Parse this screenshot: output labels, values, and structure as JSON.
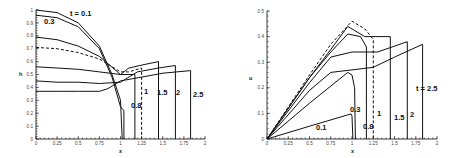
{
  "chart_data": [
    {
      "type": "line",
      "title": "",
      "xlabel": "x",
      "ylabel": "h",
      "xlim": [
        0,
        2
      ],
      "ylim": [
        0,
        1
      ],
      "xticks": [
        "0",
        "0.25",
        "0.5",
        "0.75",
        "1",
        "1.25",
        "1.5",
        "1.75",
        "2"
      ],
      "yticks": [
        "0",
        "0.1",
        "0.2",
        "0.3",
        "0.4",
        "0.5",
        "0.6",
        "0.7",
        "0.8",
        "0.9",
        "1"
      ],
      "grid": false,
      "legend": "inline curve labels",
      "series": [
        {
          "name": "t = 0.1",
          "style": "solid",
          "x": [
            0,
            0.25,
            0.5,
            0.75,
            0.9,
            1.0,
            1.02
          ],
          "y": [
            1.0,
            0.98,
            0.9,
            0.72,
            0.5,
            0.3,
            0.0
          ]
        },
        {
          "name": "0.3",
          "style": "solid",
          "x": [
            0,
            0.25,
            0.5,
            0.75,
            0.9,
            1.0,
            1.04,
            1.04
          ],
          "y": [
            0.96,
            0.94,
            0.87,
            0.7,
            0.48,
            0.25,
            0.22,
            0.0
          ]
        },
        {
          "name": "0.8",
          "style": "solid",
          "x": [
            0,
            0.25,
            0.5,
            0.75,
            1.0,
            1.17,
            1.17
          ],
          "y": [
            0.79,
            0.77,
            0.72,
            0.64,
            0.5,
            0.5,
            0.0
          ]
        },
        {
          "name": "1",
          "style": "dashed",
          "x": [
            0,
            0.25,
            0.5,
            0.75,
            1.0,
            1.1,
            1.25,
            1.25
          ],
          "y": [
            0.71,
            0.7,
            0.67,
            0.62,
            0.52,
            0.52,
            0.55,
            0.0
          ]
        },
        {
          "name": "1.5",
          "style": "solid",
          "x": [
            0,
            0.25,
            0.5,
            0.75,
            1.0,
            1.1,
            1.3,
            1.45,
            1.45
          ],
          "y": [
            0.56,
            0.55,
            0.54,
            0.52,
            0.5,
            0.55,
            0.58,
            0.6,
            0.0
          ]
        },
        {
          "name": "2",
          "style": "solid",
          "x": [
            0,
            0.25,
            0.5,
            0.75,
            1.0,
            1.2,
            1.45,
            1.65,
            1.65
          ],
          "y": [
            0.45,
            0.44,
            0.44,
            0.43,
            0.44,
            0.52,
            0.55,
            0.57,
            0.0
          ]
        },
        {
          "name": "2.5",
          "style": "solid",
          "x": [
            0,
            0.25,
            0.5,
            0.75,
            0.85,
            1.0,
            1.25,
            1.5,
            1.83,
            1.83
          ],
          "y": [
            0.37,
            0.37,
            0.37,
            0.37,
            0.39,
            0.45,
            0.48,
            0.51,
            0.53,
            0.0
          ]
        }
      ],
      "labels": {
        "xlabel": "x",
        "ylabel": "h",
        "t01": "t = 0.1",
        "t03": "0.3",
        "t08": "0.8",
        "t1": "1",
        "t15": "1.5",
        "t2": "2",
        "t25": "2.5"
      }
    },
    {
      "type": "line",
      "title": "",
      "xlabel": "x",
      "ylabel": "u",
      "xlim": [
        0,
        2
      ],
      "ylim": [
        0,
        0.5
      ],
      "xticks": [
        "0",
        "0.25",
        "0.5",
        "0.75",
        "1",
        "1.25",
        "1.5",
        "1.75",
        "2"
      ],
      "yticks": [
        "0",
        "0.1",
        "0.2",
        "0.3",
        "0.4",
        "0.5"
      ],
      "grid": false,
      "legend": "inline curve labels",
      "series": [
        {
          "name": "0.1",
          "style": "solid",
          "x": [
            0,
            0.5,
            0.99,
            1.0,
            1.01
          ],
          "y": [
            0.0,
            0.05,
            0.098,
            0.09,
            0.0
          ]
        },
        {
          "name": "0.3",
          "style": "solid",
          "x": [
            0,
            0.5,
            0.95,
            1.0,
            1.03,
            1.04
          ],
          "y": [
            0.0,
            0.14,
            0.26,
            0.25,
            0.2,
            0.0
          ]
        },
        {
          "name": "0.8",
          "style": "solid",
          "x": [
            0,
            0.5,
            0.75,
            0.95,
            1.1,
            1.17,
            1.17
          ],
          "y": [
            0.0,
            0.24,
            0.34,
            0.41,
            0.4,
            0.36,
            0.0
          ]
        },
        {
          "name": "1",
          "style": "dashed",
          "x": [
            0,
            0.5,
            0.75,
            1.0,
            1.15,
            1.25,
            1.25
          ],
          "y": [
            0.0,
            0.25,
            0.37,
            0.46,
            0.43,
            0.39,
            0.0
          ]
        },
        {
          "name": "1.5",
          "style": "solid",
          "x": [
            0,
            0.5,
            0.75,
            0.95,
            1.15,
            1.45,
            1.45
          ],
          "y": [
            0.0,
            0.24,
            0.35,
            0.44,
            0.4,
            0.4,
            0.0
          ]
        },
        {
          "name": "2",
          "style": "solid",
          "x": [
            0,
            0.5,
            0.75,
            1.0,
            1.3,
            1.65,
            1.65
          ],
          "y": [
            0.0,
            0.22,
            0.32,
            0.34,
            0.34,
            0.38,
            0.0
          ]
        },
        {
          "name": "t = 2.5",
          "style": "solid",
          "x": [
            0,
            0.5,
            0.75,
            1.0,
            1.25,
            1.5,
            1.83,
            1.83
          ],
          "y": [
            0.0,
            0.19,
            0.26,
            0.27,
            0.28,
            0.32,
            0.37,
            0.0
          ]
        }
      ],
      "labels": {
        "xlabel": "x",
        "ylabel": "u",
        "t01": "0.1",
        "t03": "0.3",
        "t08": "0.8",
        "t1": "1",
        "t15": "1.5",
        "t2": "2",
        "t25": "t = 2.5"
      }
    }
  ]
}
